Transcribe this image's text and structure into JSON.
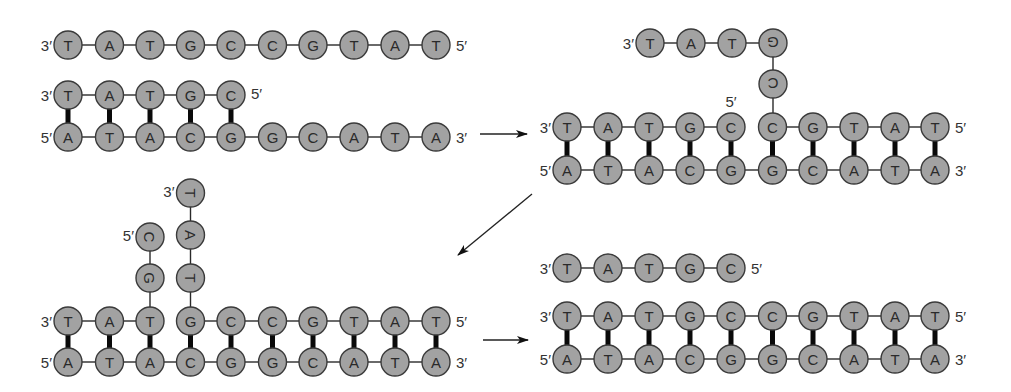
{
  "panels": [
    {
      "name": "panel-1-separate-strand-and-partial-duplex",
      "strands": [
        {
          "id": "p1-top-full",
          "sequence": [
            "T",
            "A",
            "T",
            "G",
            "C",
            "C",
            "G",
            "T",
            "A",
            "T"
          ],
          "left_end": "3′",
          "right_end": "5′"
        },
        {
          "id": "p1-short",
          "sequence": [
            "T",
            "A",
            "T",
            "G",
            "C"
          ],
          "left_end": "3′",
          "right_end": "5′"
        },
        {
          "id": "p1-bottom",
          "sequence": [
            "A",
            "T",
            "A",
            "C",
            "G",
            "G",
            "C",
            "A",
            "T",
            "A"
          ],
          "left_end": "5′",
          "right_end": "3′"
        }
      ],
      "paired_columns": 5
    },
    {
      "name": "panel-2-invasion",
      "flap": {
        "sequence": [
          "T",
          "A",
          "T",
          "G",
          "C"
        ],
        "left_end": "3′"
      },
      "top": {
        "sequence": [
          "T",
          "A",
          "T",
          "G",
          "C",
          "C",
          "G",
          "T",
          "A",
          "T"
        ],
        "left_end": "3′",
        "right_end": "5′",
        "break_label": "5′"
      },
      "bottom": {
        "sequence": [
          "A",
          "T",
          "A",
          "C",
          "G",
          "G",
          "C",
          "A",
          "T",
          "A"
        ],
        "left_end": "5′",
        "right_end": "3′"
      }
    },
    {
      "name": "panel-3-branch-migration",
      "flap_left": {
        "sequence": [
          "C",
          "G"
        ],
        "end_label": "5′"
      },
      "flap_right": {
        "sequence": [
          "T",
          "A",
          "T"
        ],
        "end_label": "3′"
      },
      "top": {
        "sequence": [
          "T",
          "A",
          "T",
          "G",
          "C",
          "C",
          "G",
          "T",
          "A",
          "T"
        ],
        "left_end": "3′",
        "right_end": "5′"
      },
      "bottom": {
        "sequence": [
          "A",
          "T",
          "A",
          "C",
          "G",
          "G",
          "C",
          "A",
          "T",
          "A"
        ],
        "left_end": "5′",
        "right_end": "3′"
      }
    },
    {
      "name": "panel-4-displaced",
      "released": {
        "sequence": [
          "T",
          "A",
          "T",
          "G",
          "C"
        ],
        "left_end": "3′",
        "right_end": "5′"
      },
      "top": {
        "sequence": [
          "T",
          "A",
          "T",
          "G",
          "C",
          "C",
          "G",
          "T",
          "A",
          "T"
        ],
        "left_end": "3′",
        "right_end": "5′"
      },
      "bottom": {
        "sequence": [
          "A",
          "T",
          "A",
          "C",
          "G",
          "G",
          "C",
          "A",
          "T",
          "A"
        ],
        "left_end": "5′",
        "right_end": "3′"
      }
    }
  ],
  "arrows": [
    "panel-1-to-panel-2",
    "panel-2-to-panel-3",
    "panel-3-to-panel-4"
  ]
}
